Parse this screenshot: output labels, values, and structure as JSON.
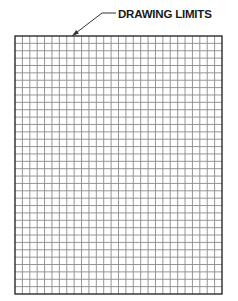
{
  "diagram": {
    "callout_label": "DRAWING LIMITS",
    "grid": {
      "left": 15,
      "top": 36,
      "right": 222,
      "bottom": 294,
      "columns": 28,
      "rows": 35,
      "line_color": "#8a8a8a",
      "border_color": "#2a2a2a"
    },
    "leader": {
      "points": [
        [
          72,
          36
        ],
        [
          102,
          13
        ],
        [
          116,
          13
        ]
      ],
      "color": "#333333"
    }
  }
}
